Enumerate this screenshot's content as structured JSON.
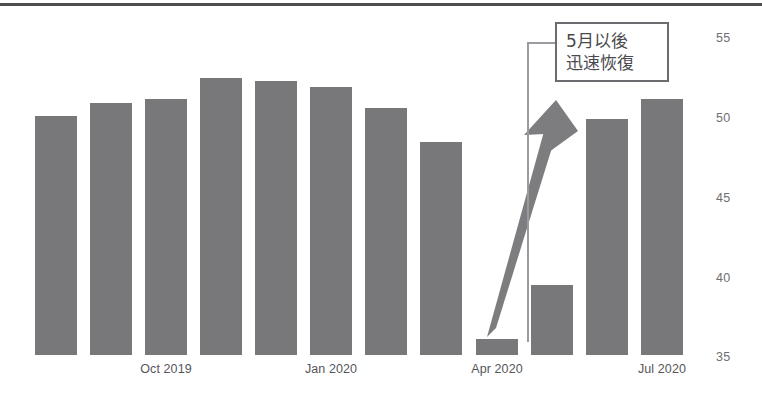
{
  "chart_data": {
    "type": "bar",
    "title": "",
    "subtitle": "",
    "xlabel": "",
    "ylabel": "",
    "ylim": [
      35,
      55
    ],
    "yticks": [
      35,
      40,
      45,
      50,
      55
    ],
    "grid": false,
    "legend": null,
    "categories": [
      "Aug 2019",
      "Sep 2019",
      "Oct 2019",
      "Nov 2019",
      "Dec 2019",
      "Jan 2020",
      "Feb 2020",
      "Mar 2020",
      "Apr 2020",
      "May 2020",
      "Jun 2020",
      "Jul 2020"
    ],
    "visible_xtick_labels": [
      {
        "label": "Oct 2019",
        "index": 2
      },
      {
        "label": "Jan 2020",
        "index": 5
      },
      {
        "label": "Apr 2020",
        "index": 8
      },
      {
        "label": "Jul 2020",
        "index": 11
      }
    ],
    "values": [
      50.1,
      50.9,
      51.2,
      52.5,
      52.3,
      51.9,
      50.6,
      48.5,
      36.1,
      39.5,
      49.9,
      51.2
    ],
    "bar_color": "#78787a",
    "annotations": [
      {
        "name": "recovery-callout",
        "lines": [
          "5月以後",
          "迅速恢復"
        ],
        "arrow": "upward-trend-arrow",
        "arrow_from_index": 8,
        "arrow_to_index": 10
      }
    ]
  },
  "axes": {
    "y_tick_labels": [
      "55",
      "50",
      "45",
      "40",
      "35"
    ],
    "x_tick_labels": [
      "Oct 2019",
      "Jan 2020",
      "Apr 2020",
      "Jul 2020"
    ]
  },
  "callout": {
    "line1": "5月以後",
    "line2": "迅速恢復"
  },
  "colors": {
    "bar": "#78787a",
    "rule": "#4e4e50",
    "callout_border": "#6b6b70",
    "arrow": "#78787a",
    "tick_text": "#6f6f71"
  }
}
